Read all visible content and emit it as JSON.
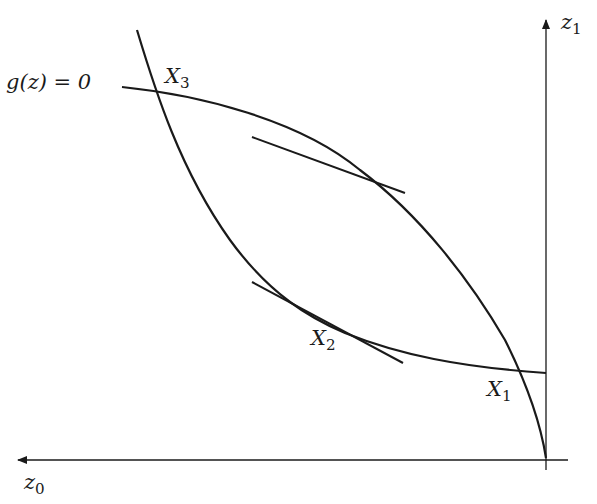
{
  "diagram": {
    "type": "curves-in-plane",
    "axes": {
      "horizontal": {
        "label_base": "z",
        "label_sub": "0",
        "direction": "left"
      },
      "vertical": {
        "label_base": "z",
        "label_sub": "1",
        "direction": "up"
      }
    },
    "curve_label": {
      "text": "g(z) = 0"
    },
    "points": [
      {
        "id": "X1",
        "base": "X",
        "sub": "1"
      },
      {
        "id": "X2",
        "base": "X",
        "sub": "2"
      },
      {
        "id": "X3",
        "base": "X",
        "sub": "3"
      }
    ],
    "colors": {
      "stroke": "#1a1a1a",
      "background": "#ffffff"
    }
  }
}
